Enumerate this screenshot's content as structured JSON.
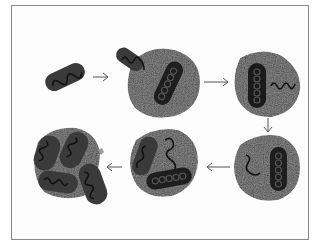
{
  "diagram": {
    "title": "",
    "stages": [
      {
        "id": 1,
        "description": "free rod-shaped particle with wavy strand"
      },
      {
        "id": 2,
        "description": "particle entering granular cell; rod with rings inside"
      },
      {
        "id": 3,
        "description": "cell with rod and free wavy strand"
      },
      {
        "id": 4,
        "description": "cell with wavy strand and rod with rings"
      },
      {
        "id": 5,
        "description": "cell with two rods and strand"
      },
      {
        "id": 6,
        "description": "cell bursting, releasing multiple rods"
      }
    ],
    "arrows": [
      {
        "from": 1,
        "to": 2,
        "direction": "right"
      },
      {
        "from": 2,
        "to": 3,
        "direction": "right"
      },
      {
        "from": 3,
        "to": 4,
        "direction": "down"
      },
      {
        "from": 4,
        "to": 5,
        "direction": "left"
      },
      {
        "from": 5,
        "to": 6,
        "direction": "left"
      }
    ],
    "colors": {
      "cell": "#9a9a9a",
      "rod": "#3a3a3a",
      "rod_dark": "#1a1a1a",
      "strand": "#111111",
      "arrow": "#555555",
      "frame": "#8a8a8a"
    }
  }
}
